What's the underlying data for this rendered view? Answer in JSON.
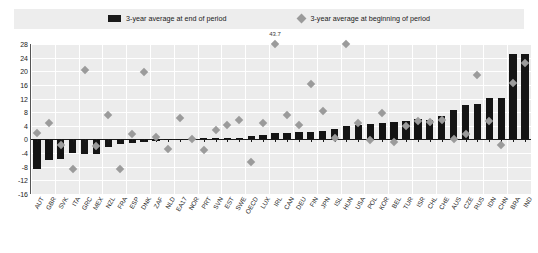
{
  "legend": {
    "items": [
      {
        "label": "3-year average at end of period",
        "marker": "bar-swatch",
        "color": "#141414"
      },
      {
        "label": "3-year average at beginning of period",
        "marker": "diamond-swatch",
        "color": "#9b9b9b"
      }
    ]
  },
  "annotation": {
    "text": "43.7",
    "category": "IRL"
  },
  "colors": {
    "bar": "#141414",
    "diamond": "#9b9b9b",
    "plot_background": "#ececec",
    "legend_background": "#ededed",
    "gridline": "#ffffff",
    "axis": "#1a1a1a"
  },
  "chart_data": {
    "type": "bar",
    "title": "",
    "subtitle": "",
    "xlabel": "",
    "ylabel": "",
    "ylim": [
      -16,
      28
    ],
    "yticks": [
      28,
      24,
      20,
      16,
      12,
      8,
      4,
      0,
      -4,
      -8,
      -12,
      -16
    ],
    "grid": true,
    "legend_position": "top",
    "categories": [
      "AUT",
      "GBR",
      "SVK",
      "ITA",
      "GRC",
      "MEX",
      "NZL",
      "FRA",
      "ESP",
      "DNK",
      "ZAF",
      "NLD",
      "EA17",
      "NOR",
      "PRT",
      "SVN",
      "EST",
      "SWE",
      "OECD",
      "LUX",
      "IRL",
      "CAN",
      "DEU",
      "FIN",
      "JPN",
      "ISL",
      "HUN",
      "USA",
      "POL",
      "KOR",
      "BEL",
      "TUR",
      "ISR",
      "CHL",
      "CHE",
      "AUS",
      "CZE",
      "RUS",
      "IDN",
      "CHN",
      "BRA",
      "IND"
    ],
    "series": [
      {
        "name": "3-year average at end of period",
        "type": "bar",
        "color": "#141414",
        "values": [
          -8.6,
          -5.9,
          -5.6,
          -4.1,
          -4.2,
          -4.3,
          -2.2,
          -1.3,
          -0.9,
          -0.7,
          -0.5,
          -0.1,
          0.0,
          0.2,
          0.5,
          0.5,
          0.5,
          0.4,
          1.1,
          1.2,
          1.9,
          1.8,
          2.1,
          2.3,
          2.6,
          3.2,
          3.9,
          4.2,
          4.5,
          4.8,
          5.1,
          5.4,
          6.1,
          5.6,
          6.9,
          8.7,
          10.1,
          10.3,
          12.1,
          12.3,
          25.1,
          25.1
        ]
      },
      {
        "name": "3-year average at beginning of period",
        "type": "scatter",
        "marker": "diamond",
        "color": "#9b9b9b",
        "values": [
          1.9,
          4.9,
          -1.5,
          -8.7,
          20.5,
          -1.8,
          7.3,
          -8.8,
          1.6,
          19.7,
          0.6,
          -2.7,
          6.2,
          0.0,
          -3.0,
          2.9,
          4.2,
          5.7,
          -6.5,
          4.9,
          43.7,
          7.3,
          4.1,
          16.3,
          8.3,
          0.3,
          28.0,
          4.8,
          -0.2,
          7.8,
          -0.6,
          4.0,
          5.4,
          5.1,
          5.6,
          0.2,
          1.7,
          18.8,
          5.5,
          -1.6,
          16.6,
          22.3
        ]
      }
    ]
  }
}
